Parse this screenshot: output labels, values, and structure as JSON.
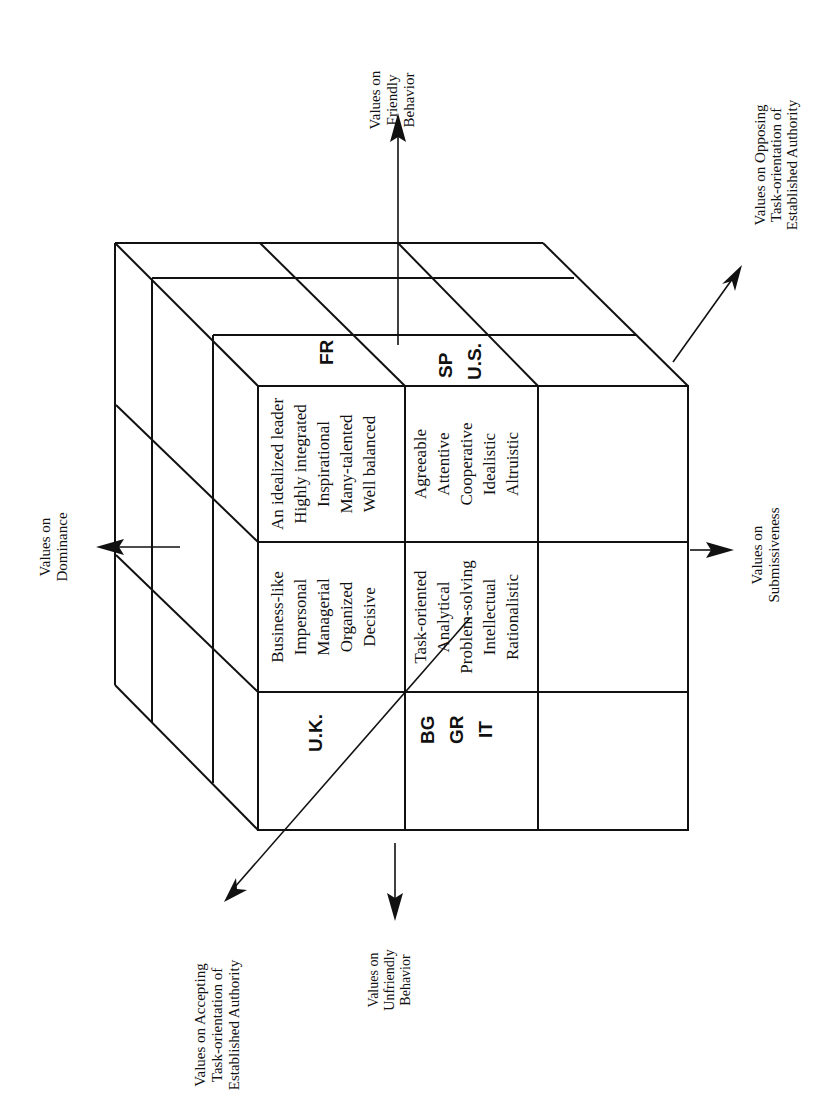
{
  "diagram": {
    "type": "3D cube of value dimensions (rotated 90 degrees)",
    "axes": {
      "friendly": [
        "Values on",
        "Friendly",
        "Behavior"
      ],
      "unfriendly": [
        "Values on",
        "Unfriendly",
        "Behavior"
      ],
      "dominance": [
        "Values on",
        "Dominance"
      ],
      "submissiveness": [
        "Values on",
        "Submissiveness"
      ],
      "opposing": [
        "Values on Opposing",
        "Task-orientation of",
        "Established Authority"
      ],
      "accepting": [
        "Values on  Accepting",
        "Task-orientation of",
        "Established Authority"
      ]
    },
    "cells": {
      "dominant_friendly": [
        "An idealized leader",
        "Highly integrated",
        "Inspirational",
        "Many-talented",
        "Well balanced"
      ],
      "submissive_friendly": [
        "Agreeable",
        "Attentive",
        "Cooperative",
        "Idealistic",
        "Altruistic"
      ],
      "dominant_neutral": [
        "Business-like",
        "Impersonal",
        "Managerial",
        "Organized",
        "Decisive"
      ],
      "submissive_neutral": [
        "Task-oriented",
        "Analytical",
        "Problem-solving",
        "Intellectual",
        "Rationalistic"
      ]
    },
    "countries": {
      "friendly_top": [
        "FR"
      ],
      "friendly_side": [
        "SP",
        "U.S."
      ],
      "neutral_top": [
        "U.K."
      ],
      "neutral_side": [
        "BG",
        "GR",
        "IT"
      ]
    }
  }
}
